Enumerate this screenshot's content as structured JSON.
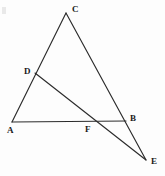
{
  "figure": {
    "width": 165,
    "height": 176,
    "background_color": "#fdfdfd",
    "stroke_color": "#2b2b2b",
    "label_color": "#1a1a1a",
    "stroke_width": 1.15
  },
  "points": {
    "A": {
      "label": "A",
      "x": 12,
      "y": 122,
      "label_x": 7,
      "label_y": 126
    },
    "B": {
      "label": "B",
      "x": 126,
      "y": 121,
      "label_x": 130,
      "label_y": 114
    },
    "C": {
      "label": "C",
      "x": 66,
      "y": 13,
      "label_x": 72,
      "label_y": 5
    },
    "D": {
      "label": "D",
      "x": 35,
      "y": 73,
      "label_x": 24,
      "label_y": 67
    },
    "E": {
      "label": "E",
      "x": 146,
      "y": 160,
      "label_x": 151,
      "label_y": 157
    },
    "F": {
      "label": "F",
      "x": 89,
      "y": 122,
      "label_x": 85,
      "label_y": 125
    }
  },
  "segments": [
    {
      "name": "side-AC",
      "from": "A",
      "to": "C"
    },
    {
      "name": "side-CE",
      "from": "C",
      "to": "E"
    },
    {
      "name": "side-AB",
      "from": "A",
      "to": "B"
    },
    {
      "name": "cevian-DE",
      "from": "D",
      "to": "E"
    }
  ],
  "artifact": {
    "x": 2,
    "y": 7,
    "width": 4,
    "height": 7
  }
}
